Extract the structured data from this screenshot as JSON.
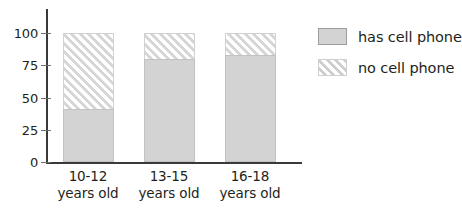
{
  "chart_data": {
    "type": "bar",
    "subtype": "stacked-percentage",
    "title": "",
    "subtitle": "",
    "xlabel": "",
    "ylabel": "",
    "ylim": [
      0,
      100
    ],
    "grid": false,
    "legend_position": "right",
    "categories": [
      "10-12\nyears old",
      "13-15\nyears old",
      "16-18\nyears old"
    ],
    "category_lines": [
      [
        "10-12",
        "years old"
      ],
      [
        "13-15",
        "years old"
      ],
      [
        "16-18",
        "years old"
      ]
    ],
    "ytick_labels": [
      "100",
      "75",
      "50",
      "25",
      "0"
    ],
    "ytick_values": [
      100,
      75,
      50,
      25,
      0
    ],
    "series": [
      {
        "name": "has cell phone",
        "values": [
          41,
          80,
          83
        ],
        "fill": "solid",
        "color": "#d3d3d3"
      },
      {
        "name": "no cell phone",
        "values": [
          59,
          20,
          17
        ],
        "fill": "diagonal-hatch",
        "color": "#d6d6d6"
      }
    ]
  },
  "legend": {
    "items": [
      {
        "label": "has cell phone",
        "swatch": "solid-gray-swatch"
      },
      {
        "label": "no cell phone",
        "swatch": "hatched-swatch"
      }
    ]
  },
  "axes": {
    "y": {
      "ticks": [
        {
          "label": "100",
          "value": 100
        },
        {
          "label": "75",
          "value": 75
        },
        {
          "label": "50",
          "value": 50
        },
        {
          "label": "25",
          "value": 25
        },
        {
          "label": "0",
          "value": 0
        }
      ]
    },
    "x": {
      "ticks": [
        {
          "line1": "10-12",
          "line2": "years old"
        },
        {
          "line1": "13-15",
          "line2": "years old"
        },
        {
          "line1": "16-18",
          "line2": "years old"
        }
      ]
    }
  },
  "colors": {
    "axis": "#3a3a3a",
    "text": "#231f20",
    "bar_solid": "#d3d3d3",
    "bar_hatch": "#d6d6d6",
    "background": "#ffffff"
  }
}
